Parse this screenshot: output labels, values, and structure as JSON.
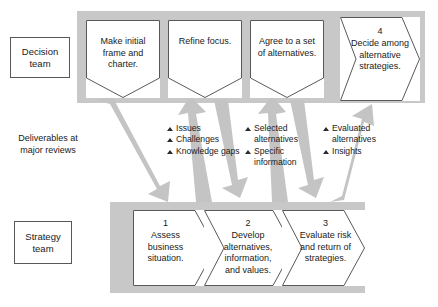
{
  "diagram": {
    "colors": {
      "band": "#c8c8c8",
      "arrow": "#c4c4c4",
      "shape_fill": "#ffffff",
      "shape_stroke": "#58585a",
      "text": "#1a1a1a"
    },
    "roles": {
      "decision": "Decision\nteam",
      "decision_line1": "Decision",
      "decision_line2": "team",
      "strategy_line1": "Strategy",
      "strategy_line2": "team"
    },
    "deliverables_label_line1": "Deliverables at",
    "deliverables_label_line2": "major reviews",
    "deliverables": [
      {
        "items": [
          "Issues",
          "Challenges",
          "Knowledge gaps"
        ]
      },
      {
        "items": [
          "Selected alternatives",
          "Specific information"
        ]
      },
      {
        "items": [
          "Evaluated alternatives",
          "Insights"
        ]
      }
    ],
    "decision_steps": [
      {
        "number": "",
        "text": "Make initial frame and charter."
      },
      {
        "number": "",
        "text": "Refine focus."
      },
      {
        "number": "",
        "text": "Agree to a set of alternatives."
      },
      {
        "number": "4",
        "text": "Decide among alternative strategies."
      }
    ],
    "strategy_steps": [
      {
        "number": "1",
        "text": "Assess business situation."
      },
      {
        "number": "2",
        "text": "Develop alternatives, information, and values."
      },
      {
        "number": "3",
        "text": "Evaluate risk and return of strategies."
      }
    ],
    "icons": {
      "bullet": "bullet-triangle-icon",
      "arrow_down": "arrow-down-icon",
      "arrow_up": "arrow-up-icon"
    }
  }
}
